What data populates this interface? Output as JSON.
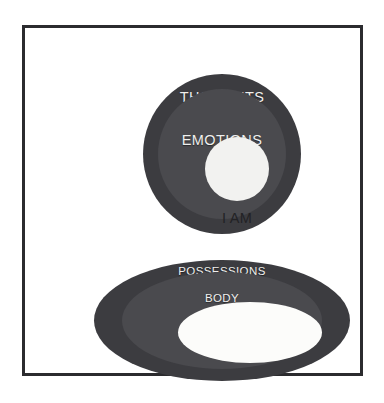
{
  "figure": {
    "background_color": "#ffffff",
    "frame": {
      "border_color": "#2b2b2e",
      "fill_color": "#ffffff"
    },
    "palette": {
      "outer_ring": "#3c3c40",
      "middle_ring": "#4a4a4e",
      "core_light": "#f2f2f0",
      "label_light": "#efefed",
      "label_dark": "#222225"
    },
    "diagrams": [
      {
        "id": "self-circle",
        "shape": "circle",
        "rings": [
          {
            "level": "outer",
            "label": "THOUGHTS",
            "color": "#3c3c40",
            "label_color": "#efefed"
          },
          {
            "level": "middle",
            "label": "EMOTIONS",
            "color": "#4a4a4e",
            "label_color": "#efefed"
          },
          {
            "level": "core",
            "label": "I AM",
            "color": "#f2f2f0",
            "label_color": "#222225"
          }
        ]
      },
      {
        "id": "external-ellipse",
        "shape": "ellipse",
        "rings": [
          {
            "level": "outer",
            "label": "POSSESSIONS",
            "color": "#3c3c40",
            "label_color": "#efefed"
          },
          {
            "level": "middle",
            "label": "BODY",
            "color": "#4a4a4e",
            "label_color": "#efefed"
          },
          {
            "level": "core",
            "label": "",
            "color": "#fcfcfa",
            "label_color": "#222225"
          }
        ]
      }
    ]
  }
}
